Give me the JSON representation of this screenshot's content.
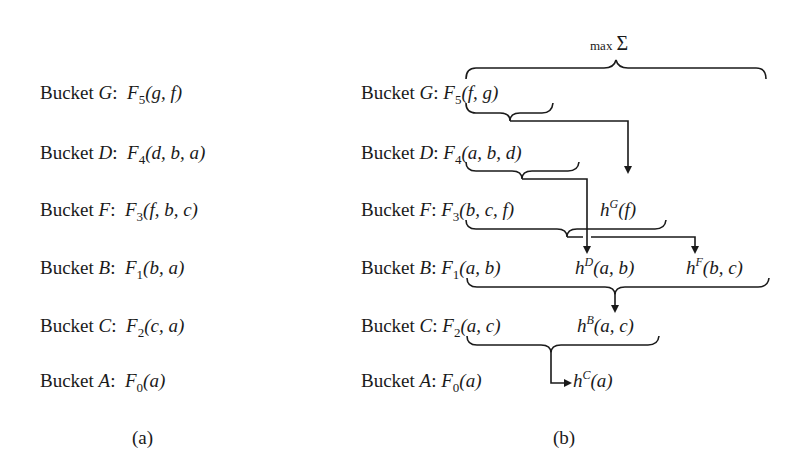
{
  "panel_a": {
    "caption": "(a)",
    "rows": [
      {
        "bucket_label": "Bucket ",
        "bucket_var": "G",
        "func": "F",
        "sub": "5",
        "args": "(g, f)"
      },
      {
        "bucket_label": "Bucket ",
        "bucket_var": "D",
        "func": "F",
        "sub": "4",
        "args": "(d, b, a)"
      },
      {
        "bucket_label": "Bucket ",
        "bucket_var": "F",
        "func": "F",
        "sub": "3",
        "args": "(f, b, c)"
      },
      {
        "bucket_label": "Bucket ",
        "bucket_var": "B",
        "func": "F",
        "sub": "1",
        "args": "(b, a)"
      },
      {
        "bucket_label": "Bucket ",
        "bucket_var": "C",
        "func": "F",
        "sub": "2",
        "args": "(c, a)"
      },
      {
        "bucket_label": "Bucket ",
        "bucket_var": "A",
        "func": "F",
        "sub": "0",
        "args": "(a)"
      }
    ]
  },
  "panel_b": {
    "caption": "(b)",
    "operator_label": {
      "max": "max",
      "sigma": "Σ"
    },
    "rows": [
      {
        "bucket_label": "Bucket ",
        "bucket_var": "G",
        "func": "F",
        "sub": "5",
        "args": "(f, g)",
        "messages": []
      },
      {
        "bucket_label": "Bucket ",
        "bucket_var": "D",
        "func": "F",
        "sub": "4",
        "args": "(a, b, d)",
        "messages": []
      },
      {
        "bucket_label": "Bucket ",
        "bucket_var": "F",
        "func": "F",
        "sub": "3",
        "args": "(b, c, f)",
        "messages": [
          {
            "h": "h",
            "sup": "G",
            "args": "(f)"
          }
        ]
      },
      {
        "bucket_label": "Bucket ",
        "bucket_var": "B",
        "func": "F",
        "sub": "1",
        "args": "(a, b)",
        "messages": [
          {
            "h": "h",
            "sup": "D",
            "args": "(a, b)"
          },
          {
            "h": "h",
            "sup": "F",
            "args": "(b, c)"
          }
        ]
      },
      {
        "bucket_label": "Bucket ",
        "bucket_var": "C",
        "func": "F",
        "sub": "2",
        "args": "(a, c)",
        "messages": [
          {
            "h": "h",
            "sup": "B",
            "args": "(a, c)"
          }
        ]
      },
      {
        "bucket_label": "Bucket ",
        "bucket_var": "A",
        "func": "F",
        "sub": "0",
        "args": "(a)",
        "messages": [
          {
            "h": "h",
            "sup": "C",
            "args": "(a)"
          }
        ]
      }
    ]
  },
  "colors": {
    "ink": "#1a1a1a",
    "background": "#ffffff"
  }
}
